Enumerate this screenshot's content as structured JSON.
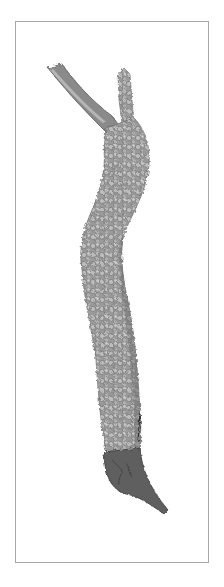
{
  "image": {
    "subject": "Botanical drawing of a lichen-covered forked branch",
    "style": "graphite pencil illustration",
    "background_color": "#ffffff",
    "frame_color": "#a8a8a8",
    "palette": {
      "light": "#bdbdbd",
      "mid": "#8e8e8e",
      "dark": "#5a5a5a",
      "darkest": "#3a3a3a"
    }
  }
}
